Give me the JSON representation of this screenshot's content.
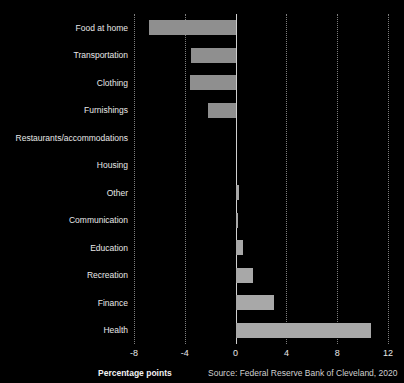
{
  "title_strip": {
    "text": ""
  },
  "footer": {
    "xaxis_title": "Percentage points",
    "source": "Source: Federal Reserve Bank of Cleveland, 2020"
  },
  "colors": {
    "background": "#000000",
    "bar_positive": "#a8a8a8",
    "bar_negative": "#8f8f8f",
    "gridline": "#7d7d7d",
    "zero_line": "#cfcfcf",
    "text": "#e8e8e8"
  },
  "chart_data": {
    "type": "bar",
    "orientation": "horizontal",
    "title": "",
    "xlabel": "Percentage points",
    "ylabel": "",
    "xlim": [
      -8,
      12
    ],
    "xticks": [
      -8,
      -4,
      0,
      4,
      8,
      12
    ],
    "xticklabels": [
      "-8",
      "-4",
      "0",
      "4",
      "8",
      "12"
    ],
    "grid": "vertical-dotted",
    "legend": "none",
    "source": "Source: Federal Reserve Bank of Cleveland, 2020",
    "categories": [
      "Food at home",
      "Transportation",
      "Clothing",
      "Furnishings",
      "Restaurants/accommodations",
      "Housing",
      "Other",
      "Communication",
      "Education",
      "Recreation",
      "Finance",
      "Health"
    ],
    "values": [
      -6.8,
      -3.5,
      -3.6,
      -2.2,
      0.0,
      0.0,
      0.3,
      0.2,
      0.6,
      1.4,
      3.0,
      10.7
    ]
  }
}
